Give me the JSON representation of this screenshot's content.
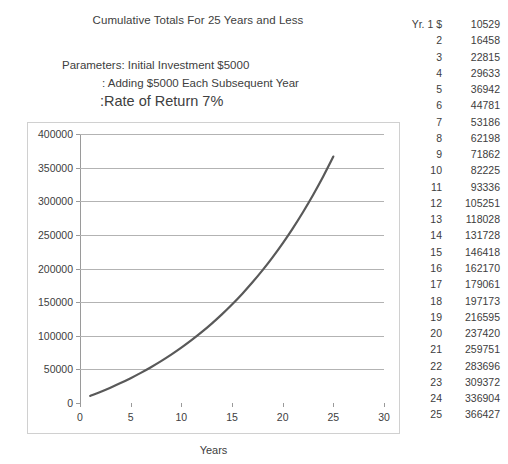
{
  "header": {
    "chart_title": "Cumulative Totals For 25 Years and Less",
    "param_line_1": "Parameters: Initial Investment $5000",
    "param_line_2": ": Adding $5000 Each Subsequent Year",
    "param_line_3": ":Rate of Return 7%"
  },
  "table": {
    "year_header": "Yr. 1 $",
    "rows": [
      {
        "yr": "Yr. 1 $",
        "val": "10529"
      },
      {
        "yr": "2",
        "val": "16458"
      },
      {
        "yr": "3",
        "val": "22815"
      },
      {
        "yr": "4",
        "val": "29633"
      },
      {
        "yr": "5",
        "val": "36942"
      },
      {
        "yr": "6",
        "val": "44781"
      },
      {
        "yr": "7",
        "val": "53186"
      },
      {
        "yr": "8",
        "val": "62198"
      },
      {
        "yr": "9",
        "val": "71862"
      },
      {
        "yr": "10",
        "val": "82225"
      },
      {
        "yr": "11",
        "val": "93336"
      },
      {
        "yr": "12",
        "val": "105251"
      },
      {
        "yr": "13",
        "val": "118028"
      },
      {
        "yr": "14",
        "val": "131728"
      },
      {
        "yr": "15",
        "val": "146418"
      },
      {
        "yr": "16",
        "val": "162170"
      },
      {
        "yr": "17",
        "val": "179061"
      },
      {
        "yr": "18",
        "val": "197173"
      },
      {
        "yr": "19",
        "val": "216595"
      },
      {
        "yr": "20",
        "val": "237420"
      },
      {
        "yr": "21",
        "val": "259751"
      },
      {
        "yr": "22",
        "val": "283696"
      },
      {
        "yr": "23",
        "val": "309372"
      },
      {
        "yr": "24",
        "val": "336904"
      },
      {
        "yr": "25",
        "val": "366427"
      }
    ]
  },
  "chart_data": {
    "type": "line",
    "title": "Cumulative Totals For 25 Years and Less",
    "xlabel": "Years",
    "ylabel": "",
    "xlim": [
      0,
      30
    ],
    "ylim": [
      0,
      400000
    ],
    "xticks": [
      0,
      5,
      10,
      15,
      20,
      25,
      30
    ],
    "yticks": [
      0,
      50000,
      100000,
      150000,
      200000,
      250000,
      300000,
      350000,
      400000
    ],
    "grid": true,
    "legend": false,
    "line_color": "#595959",
    "x": [
      1,
      2,
      3,
      4,
      5,
      6,
      7,
      8,
      9,
      10,
      11,
      12,
      13,
      14,
      15,
      16,
      17,
      18,
      19,
      20,
      21,
      22,
      23,
      24,
      25
    ],
    "values": [
      10529,
      16458,
      22815,
      29633,
      36942,
      44781,
      53186,
      62198,
      71862,
      82225,
      93336,
      105251,
      118028,
      131728,
      146418,
      162170,
      179061,
      197173,
      216595,
      237420,
      259751,
      283696,
      309372,
      336904,
      366427
    ]
  }
}
